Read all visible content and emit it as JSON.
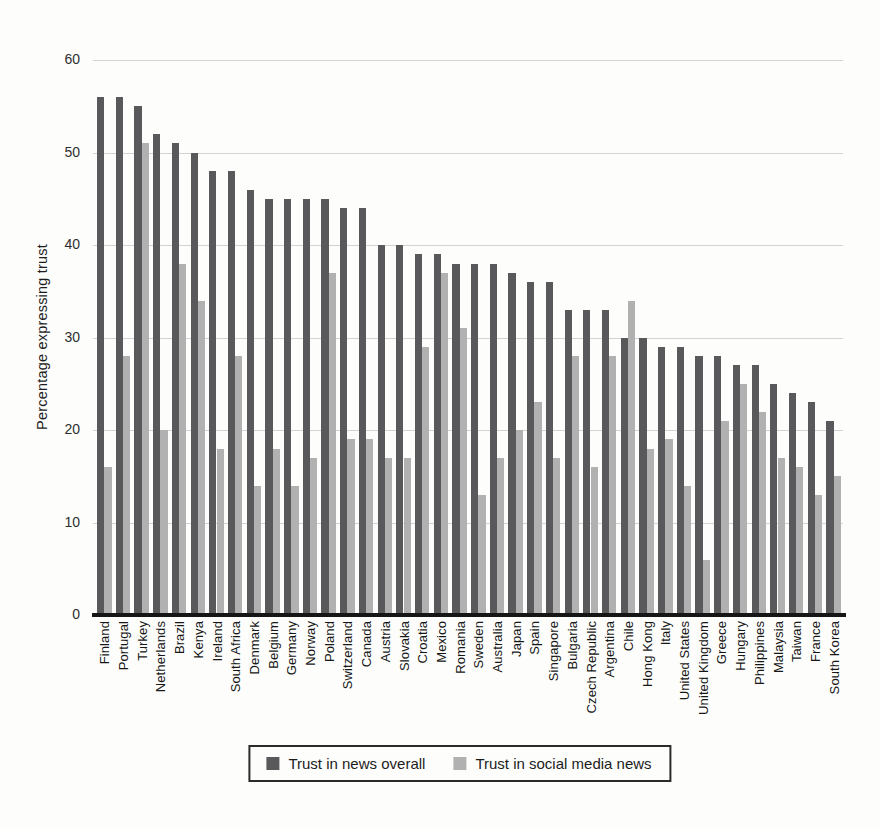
{
  "figure": {
    "background_color": "#fdfdfc",
    "axis_color": "#161616",
    "gridline_color": "#cbcbcb"
  },
  "chart_data": {
    "type": "bar",
    "title": "",
    "xlabel": "",
    "ylabel": "Percentage expressing trust",
    "ylim": [
      0,
      60
    ],
    "yticks": [
      0,
      10,
      20,
      30,
      40,
      50,
      60
    ],
    "grid": true,
    "legend_position": "bottom",
    "categories": [
      "Finland",
      "Portugal",
      "Turkey",
      "Netherlands",
      "Brazil",
      "Kenya",
      "Ireland",
      "South Africa",
      "Denmark",
      "Belgium",
      "Germany",
      "Norway",
      "Poland",
      "Switzerland",
      "Canada",
      "Austria",
      "Slovakia",
      "Croatia",
      "Mexico",
      "Romania",
      "Sweden",
      "Australia",
      "Japan",
      "Spain",
      "Singapore",
      "Bulgaria",
      "Czech Republic",
      "Argentina",
      "Chile",
      "Hong Kong",
      "Italy",
      "United States",
      "United Kingdom",
      "Greece",
      "Hungary",
      "Philippines",
      "Malaysia",
      "Taiwan",
      "France",
      "South Korea"
    ],
    "series": [
      {
        "name": "Trust in news overall",
        "color": "#59595b",
        "values": [
          56,
          56,
          55,
          52,
          51,
          50,
          48,
          48,
          46,
          45,
          45,
          45,
          45,
          44,
          44,
          40,
          40,
          39,
          39,
          38,
          38,
          38,
          37,
          36,
          36,
          33,
          33,
          33,
          30,
          30,
          29,
          29,
          28,
          28,
          27,
          27,
          25,
          24,
          23,
          21
        ]
      },
      {
        "name": "Trust in social media news",
        "color": "#b1b1b1",
        "values": [
          16,
          28,
          51,
          20,
          38,
          34,
          18,
          28,
          14,
          18,
          14,
          17,
          37,
          19,
          19,
          17,
          17,
          29,
          37,
          31,
          13,
          17,
          20,
          23,
          17,
          28,
          16,
          28,
          34,
          18,
          19,
          14,
          6,
          21,
          25,
          22,
          17,
          16,
          13,
          15
        ]
      }
    ]
  }
}
